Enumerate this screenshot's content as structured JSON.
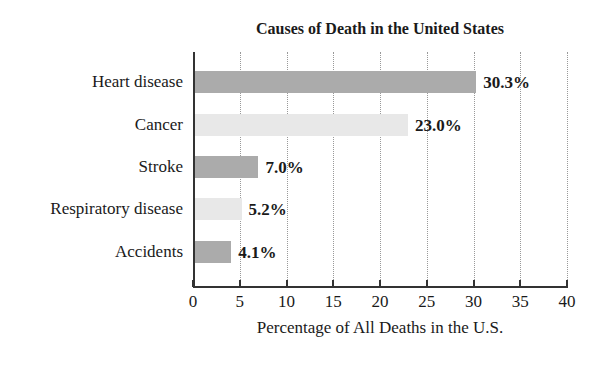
{
  "chart_data": {
    "type": "bar",
    "orientation": "horizontal",
    "title": "Causes of Death in the United States",
    "xlabel": "Percentage of All Deaths in the U.S.",
    "ylabel": "",
    "categories": [
      "Heart disease",
      "Cancer",
      "Stroke",
      "Respiratory disease",
      "Accidents"
    ],
    "values": [
      30.3,
      23.0,
      7.0,
      5.2,
      4.1
    ],
    "value_labels": [
      "30.3%",
      "23.0%",
      "7.0%",
      "5.2%",
      "4.1%"
    ],
    "xlim": [
      0,
      40
    ],
    "xticks": [
      "0",
      "5",
      "10",
      "15",
      "20",
      "25",
      "30",
      "35",
      "40"
    ],
    "grid": "vertical dotted",
    "legend": "none",
    "colors": [
      "#ababab",
      "#e8e8e8",
      "#ababab",
      "#e8e8e8",
      "#ababab"
    ]
  }
}
